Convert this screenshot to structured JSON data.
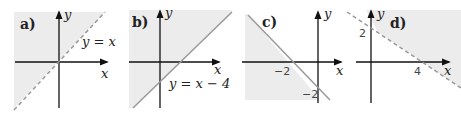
{
  "colors": {
    "shade": "#ececec",
    "axis": "#111111",
    "line": "#9a9a9a",
    "text": "#222222"
  },
  "panels": [
    {
      "label": "a)",
      "x_axis_label": "x",
      "y_axis_label": "y",
      "line_label": "y = x",
      "line_style": "dashed",
      "shaded": "left/above line y = x",
      "tick_labels": []
    },
    {
      "label": "b)",
      "x_axis_label": "x",
      "y_axis_label": "y",
      "line_label": "y = x − 4",
      "line_style": "solid",
      "shaded": "left/above line y = x − 4",
      "tick_labels": []
    },
    {
      "label": "c)",
      "x_axis_label": "x",
      "y_axis_label": "y",
      "line_label": "",
      "line_style": "solid",
      "shaded": "left/below line through (−2,0) and (0,−2)",
      "tick_labels": [
        "−2",
        "−2"
      ]
    },
    {
      "label": "d)",
      "x_axis_label": "x",
      "y_axis_label": "y",
      "line_label": "",
      "line_style": "dashed",
      "shaded": "right/above line through (0,2) and (4,0)",
      "tick_labels": [
        "2",
        "4"
      ]
    }
  ]
}
